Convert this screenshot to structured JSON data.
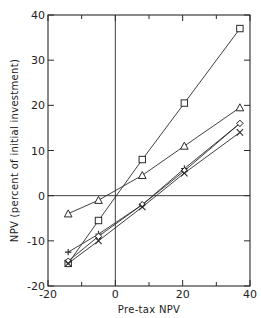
{
  "chart_data": {
    "type": "line",
    "title": "",
    "xlabel": "Pre-tax NPV",
    "ylabel": "NPV (percent of initial investment)",
    "xlim": [
      -20,
      40
    ],
    "ylim": [
      -20,
      40
    ],
    "x_ticks": [
      -20,
      0,
      20,
      40
    ],
    "x_tick_labels": [
      "-20",
      "0",
      "20",
      "40"
    ],
    "x_minor_ticks": [
      -10,
      10,
      30
    ],
    "y_ticks": [
      -20,
      -10,
      0,
      10,
      20,
      30,
      40
    ],
    "y_tick_labels": [
      "-20",
      "-10",
      "0",
      "10",
      "20",
      "30",
      "40"
    ],
    "grid": false,
    "reference_lines": {
      "x": 0,
      "y": 0
    },
    "legend": null,
    "x": [
      -14,
      -5,
      8,
      20.5,
      37
    ],
    "series": [
      {
        "name": "square",
        "marker": "square",
        "values": [
          -15,
          -5.5,
          8,
          20.5,
          37
        ]
      },
      {
        "name": "triangle",
        "marker": "triangle",
        "values": [
          -4,
          -1,
          4.5,
          11,
          19.5
        ]
      },
      {
        "name": "plus",
        "marker": "plus",
        "values": [
          -12.5,
          -8.5,
          -2,
          6,
          16
        ]
      },
      {
        "name": "diamond",
        "marker": "diamond",
        "values": [
          -14.5,
          -9,
          -2,
          5.5,
          16
        ]
      },
      {
        "name": "cross",
        "marker": "x",
        "values": [
          -15,
          -10,
          -2.5,
          5,
          14
        ]
      }
    ]
  }
}
